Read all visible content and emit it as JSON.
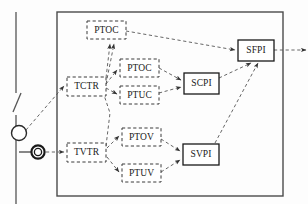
{
  "diagram": {
    "type": "block-diagram",
    "container": {
      "name": "protection-ied-container",
      "x": 57,
      "y": 12,
      "width": 226,
      "height": 184
    },
    "nodes": [
      {
        "id": "ptoc_top",
        "label": "PTOC",
        "style": "dashed",
        "x": 87,
        "y": 21,
        "w": 39,
        "h": 18
      },
      {
        "id": "tctr",
        "label": "TCTR",
        "style": "dashed",
        "x": 67,
        "y": 77,
        "w": 39,
        "h": 19
      },
      {
        "id": "ptoc_2",
        "label": "PTOC",
        "style": "dashed",
        "x": 120,
        "y": 59,
        "w": 39,
        "h": 18
      },
      {
        "id": "ptuc",
        "label": "PTUC",
        "style": "dashed",
        "x": 120,
        "y": 86,
        "w": 39,
        "h": 18
      },
      {
        "id": "tvtr",
        "label": "TVTR",
        "style": "dashed",
        "x": 67,
        "y": 143,
        "w": 39,
        "h": 19
      },
      {
        "id": "ptov",
        "label": "PTOV",
        "style": "dashed",
        "x": 122,
        "y": 128,
        "w": 39,
        "h": 18
      },
      {
        "id": "ptuv",
        "label": "PTUV",
        "style": "dashed",
        "x": 122,
        "y": 164,
        "w": 39,
        "h": 18
      },
      {
        "id": "scpi",
        "label": "SCPI",
        "style": "solid",
        "x": 184,
        "y": 73,
        "w": 35,
        "h": 21
      },
      {
        "id": "svpi",
        "label": "SVPI",
        "style": "solid",
        "x": 183,
        "y": 144,
        "w": 36,
        "h": 21
      },
      {
        "id": "sfpi",
        "label": "SFPI",
        "style": "solid",
        "x": 238,
        "y": 40,
        "w": 36,
        "h": 21
      }
    ],
    "edges": [
      {
        "from": "ct",
        "to": "tctr",
        "style": "dashed"
      },
      {
        "from": "vt",
        "to": "tvtr",
        "style": "dashed"
      },
      {
        "from": "tctr",
        "to": "ptoc_top",
        "style": "dashed"
      },
      {
        "from": "tctr",
        "to": "ptoc_2",
        "style": "dashed"
      },
      {
        "from": "tctr",
        "to": "ptuc",
        "style": "dashed"
      },
      {
        "from": "tvtr",
        "to": "ptoc_top",
        "style": "dashed"
      },
      {
        "from": "tvtr",
        "to": "ptov",
        "style": "dashed"
      },
      {
        "from": "tvtr",
        "to": "ptuv",
        "style": "dashed"
      },
      {
        "from": "ptoc_top",
        "to": "sfpi",
        "style": "dashed"
      },
      {
        "from": "ptoc_2",
        "to": "scpi",
        "style": "dashed"
      },
      {
        "from": "ptuc",
        "to": "scpi",
        "style": "dashed"
      },
      {
        "from": "ptov",
        "to": "svpi",
        "style": "dashed"
      },
      {
        "from": "ptuv",
        "to": "svpi",
        "style": "dashed"
      },
      {
        "from": "scpi",
        "to": "sfpi",
        "style": "dashed"
      },
      {
        "from": "svpi",
        "to": "sfpi",
        "style": "dashed"
      },
      {
        "from": "sfpi",
        "to": "external",
        "style": "dashed"
      }
    ],
    "symbols": [
      {
        "id": "bus",
        "name": "busbar-line",
        "shape": "vertical-line-with-switch"
      },
      {
        "id": "ct",
        "name": "current-transformer",
        "shape": "single-circle",
        "cx": 19,
        "cy": 133,
        "r": 7
      },
      {
        "id": "vt",
        "name": "voltage-transformer",
        "shape": "double-circle",
        "cx": 38,
        "cy": 152,
        "r": 7
      }
    ]
  },
  "labels": {
    "ptoc_top": "PTOC",
    "tctr": "TCTR",
    "ptoc_2": "PTOC",
    "ptuc": "PTUC",
    "tvtr": "TVTR",
    "ptov": "PTOV",
    "ptuv": "PTUV",
    "scpi": "SCPI",
    "svpi": "SVPI",
    "sfpi": "SFPI"
  }
}
